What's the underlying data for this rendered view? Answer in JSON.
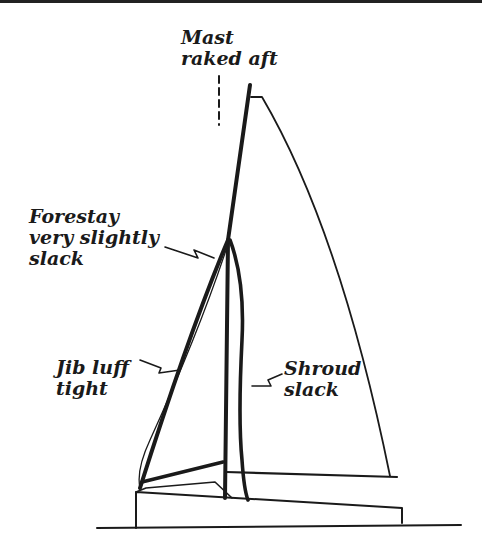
{
  "diagram": {
    "labels": {
      "mast_line1": "Mast",
      "mast_line2": "raked aft",
      "forestay_line1": "Forestay",
      "forestay_line2": "very slightly",
      "forestay_line3": "slack",
      "jib_line1": "Jib luff",
      "jib_line2": "tight",
      "shroud_line1": "Shroud",
      "shroud_line2": "slack"
    },
    "colors": {
      "ink": "#1a1a1a",
      "background": "#ffffff"
    }
  }
}
